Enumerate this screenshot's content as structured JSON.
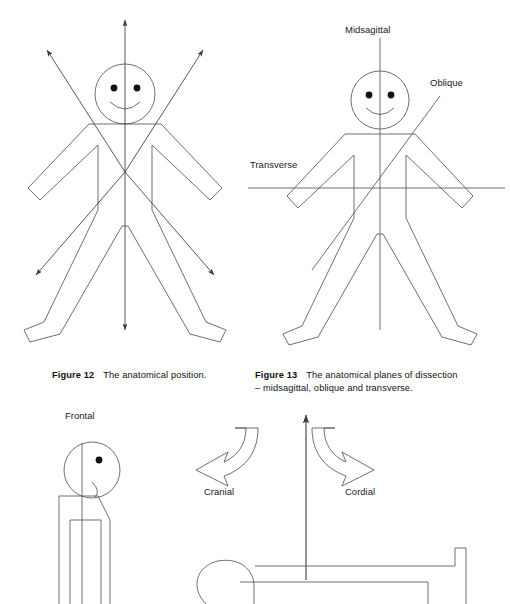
{
  "page": {
    "width": 510,
    "height": 604,
    "background": "#ffffff",
    "ink": "#3a3a3a",
    "text_color": "#1a1a1a"
  },
  "figure12": {
    "id": "figure-12",
    "caption_label": "Figure 12",
    "caption_text": "The anatomical position.",
    "description": "Stick figure in anatomical position with six directional arrows radiating from the body",
    "arrows": [
      {
        "name": "superior-arrow",
        "direction": "up"
      },
      {
        "name": "upper-left-arrow",
        "direction": "upper-left"
      },
      {
        "name": "upper-right-arrow",
        "direction": "upper-right"
      },
      {
        "name": "lower-left-arrow",
        "direction": "lower-left"
      },
      {
        "name": "lower-right-arrow",
        "direction": "lower-right"
      },
      {
        "name": "inferior-arrow",
        "direction": "down"
      }
    ]
  },
  "figure13": {
    "id": "figure-13",
    "caption_label": "Figure 13",
    "caption_text": "The anatomical planes of dissection",
    "caption_text_line2": "– midsagittal, oblique and transverse.",
    "description": "Stick figure with three plane lines drawn through the body",
    "planes": [
      {
        "name": "midsagittal-plane",
        "label": "Midsagittal",
        "orientation": "vertical"
      },
      {
        "name": "oblique-plane",
        "label": "Oblique",
        "orientation": "diagonal"
      },
      {
        "name": "transverse-plane",
        "label": "Transverse",
        "orientation": "horizontal"
      }
    ]
  },
  "figure14": {
    "id": "figure-14",
    "description": "Lateral view stick figure with frontal plane and directional curved arrows",
    "labels": [
      {
        "name": "frontal-label",
        "text": "Frontal"
      },
      {
        "name": "cranial-label",
        "text": "Cranial"
      },
      {
        "name": "cordial-label",
        "text": "Cordial"
      }
    ],
    "arrows": [
      {
        "name": "cranial-curved-arrow",
        "direction": "curve-left-down"
      },
      {
        "name": "cordial-curved-arrow",
        "direction": "curve-right-down"
      },
      {
        "name": "vertical-up-arrow",
        "direction": "up"
      }
    ]
  }
}
